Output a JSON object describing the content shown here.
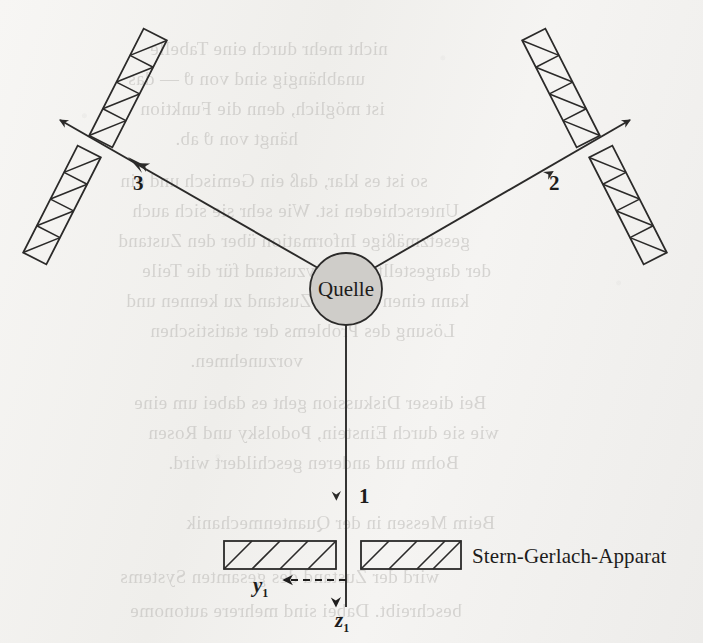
{
  "figure": {
    "caption_title": "Stern-Gerlach-Apparat",
    "source_label": "Quelle",
    "background_color": "#f3f2f0",
    "ink_color": "#2b2a29",
    "source_fill_color": "#cfcdc9"
  },
  "branches": [
    {
      "id": "1",
      "label": "1",
      "direction": "down",
      "description": "vertical beam into Stern-Gerlach apparatus"
    },
    {
      "id": "2",
      "label": "2",
      "direction": "upper-right",
      "description": "beam to upper right magnet pair"
    },
    {
      "id": "3",
      "label": "3",
      "direction": "upper-left",
      "description": "beam to upper left magnet pair"
    }
  ],
  "axes": [
    {
      "name": "y1",
      "label": "y",
      "subscript": "1",
      "arrow": "left",
      "style": "dashed"
    },
    {
      "name": "z1",
      "label": "z",
      "subscript": "1",
      "arrow": "down",
      "style": "solid"
    }
  ],
  "magnets": {
    "count": 6,
    "hatch_style": "diagonal",
    "groups": [
      {
        "branch": "1",
        "orientation": "horizontal",
        "bars": 2
      },
      {
        "branch": "2",
        "orientation": "tilted",
        "bars": 2
      },
      {
        "branch": "3",
        "orientation": "tilted",
        "bars": 2
      }
    ]
  },
  "ghost_text": {
    "note": "faint show-through text from reverse side of page",
    "lines": [
      "nicht mehr durch eine Tabelle",
      "unabhängig sind von ϑ — das",
      "ist möglich, denn die Funktion",
      "hängt von ϑ ab.",
      "",
      "so ist es klar, daß ein Gemisch und ein",
      "Unterschieden ist. Wie sehr sie sich auch",
      "gesetzmäßige Information über den Zustand",
      "der dargestellte Relativzustand für die Teile",
      "kann einen solchen Zustand zu kennen und",
      "Lösung des Problems der statistischen",
      "vorzunehmen.",
      "",
      "Bei dieser Diskussion geht es dabei um eine",
      "wie sie durch Einstein, Podolsky und Rosen",
      "Bohm und anderen geschildert wird.",
      "",
      "Beim Messen in der Quantenmechanik",
      "wird der Zustand des gesamten Systems",
      "beschreibt. Dabei sind mehrere autonome"
    ]
  }
}
